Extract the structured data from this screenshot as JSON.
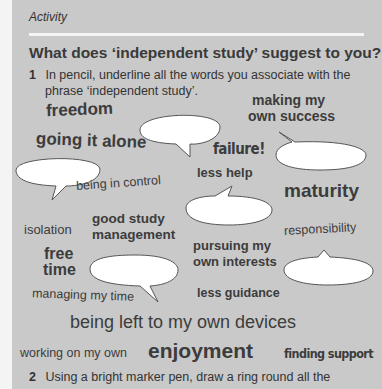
{
  "header": {
    "label": "Activity"
  },
  "title": "What does ‘independent study’ suggest to you?",
  "instructions": [
    {
      "number": "1",
      "line1": "In pencil, underline all the words you associate with the",
      "line2": "phrase ‘independent study’."
    },
    {
      "number": "2",
      "line1": "Using a bright marker pen, draw a ring round all the"
    }
  ],
  "words": {
    "freedom": "freedom",
    "making": "making my",
    "own_success": "own success",
    "going_alone": "going it alone",
    "failure": "failure!",
    "being_control": "being in control",
    "less_help": "less help",
    "maturity": "maturity",
    "isolation": "isolation",
    "good_study": "good study",
    "management": "management",
    "responsibility": "responsibility",
    "free": "free",
    "time": "time",
    "pursuing": "pursuing my",
    "own_interests": "own interests",
    "managing_time": "managing my time",
    "less_guidance": "less guidance",
    "left_devices": "being left to my own devices",
    "working_own": "working on my own",
    "enjoyment": "enjoyment",
    "finding_support": "finding support"
  }
}
